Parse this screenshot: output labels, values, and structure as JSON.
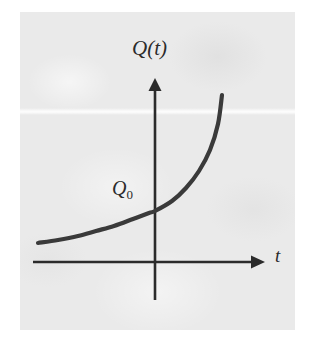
{
  "figure": {
    "kind": "math-plot",
    "caption_text": "",
    "background_color": "#ffffff",
    "panel_color": "#eaeaea",
    "ink_color": "#2b2b2b",
    "curve_color": "#3a3a3a"
  },
  "labels": {
    "vertical_axis": "Q(t)",
    "initial_value_base": "Q",
    "initial_value_subscript": "0",
    "horizontal_axis": "t"
  },
  "icons": {
    "vertical_arrow": "arrow-up-icon",
    "horizontal_arrow": "arrow-right-icon"
  },
  "chart_data": {
    "type": "line",
    "title": "",
    "subtitle": "",
    "xlabel": "t",
    "ylabel": "Q(t)",
    "legend": [],
    "legend_position": "none",
    "grid": false,
    "annotations": [
      {
        "text": "Q0",
        "describes": "y-intercept of the curve, the initial quantity at t = 0",
        "x": 0.0,
        "y": 1.0
      }
    ],
    "axes": {
      "x_axis_y_pixel": 262,
      "y_axis_x_pixel": 155,
      "x_axis_start_pixel": 33,
      "x_axis_arrow_tip_pixel": 262,
      "y_axis_bottom_pixel": 300,
      "y_axis_arrow_tip_pixel": 78,
      "x_tick_labels": [],
      "y_tick_labels": [],
      "xlim": [
        -2.6,
        2.4
      ],
      "ylim": [
        0,
        4.0
      ]
    },
    "series": [
      {
        "name": "Q(t) = Q0 * e^(kt)",
        "description": "increasing exponential growth curve passing through Q0 on the vertical axis",
        "x": [
          -2.6,
          -2.2,
          -1.8,
          -1.4,
          -1.0,
          -0.6,
          -0.2,
          0.0,
          0.25,
          0.5,
          0.75,
          1.0,
          1.25,
          1.5
        ],
        "y": [
          0.38,
          0.44,
          0.52,
          0.61,
          0.72,
          0.85,
          0.96,
          1.0,
          1.26,
          1.58,
          1.98,
          2.49,
          3.12,
          3.72
        ],
        "pixel_points": [
          [
            38,
            243
          ],
          [
            58,
            240
          ],
          [
            78,
            236
          ],
          [
            96,
            231
          ],
          [
            114,
            226
          ],
          [
            133,
            219
          ],
          [
            149,
            213
          ],
          [
            155,
            211
          ],
          [
            172,
            201
          ],
          [
            186,
            188
          ],
          [
            199,
            171
          ],
          [
            210,
            150
          ],
          [
            218,
            124
          ],
          [
            222,
            95
          ]
        ]
      }
    ]
  }
}
